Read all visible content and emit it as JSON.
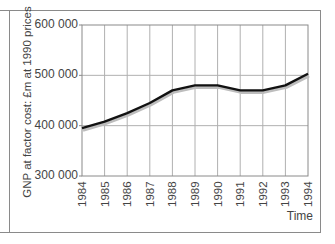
{
  "chart_data": {
    "type": "line",
    "title": "",
    "xlabel": "Time",
    "ylabel": "GNP at factor cost: £m at 1990 prices",
    "x": [
      "1984",
      "1985",
      "1986",
      "1987",
      "1988",
      "1989",
      "1990",
      "1991",
      "1992",
      "1993",
      "1994"
    ],
    "series": [
      {
        "name": "GNP",
        "values": [
          395000,
          408000,
          425000,
          445000,
          470000,
          480000,
          480000,
          470000,
          470000,
          480000,
          503000
        ],
        "color": "#111111"
      }
    ],
    "ylim": [
      300000,
      600000
    ],
    "yticks": [
      300000,
      400000,
      500000,
      600000
    ],
    "ytick_labels": [
      "300 000",
      "400 000",
      "500 000",
      "600 000"
    ],
    "grid": true,
    "legend": null
  },
  "axis": {
    "ylabel": "GNP at factor cost: £m at 1990 prices",
    "xlabel": "Time",
    "yticks": [
      "600 000",
      "500 000",
      "400 000",
      "300 000"
    ],
    "xticks": [
      "1984",
      "1985",
      "1986",
      "1987",
      "1988",
      "1989",
      "1990",
      "1991",
      "1992",
      "1993",
      "1994"
    ]
  },
  "colors": {
    "line": "#111111",
    "shadow": "#bdbdbd",
    "grid": "#b0b0b0",
    "axis": "#8a8a8a"
  }
}
